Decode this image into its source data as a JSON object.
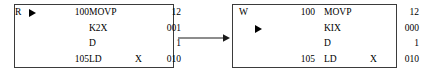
{
  "diagram": {
    "connector": {
      "icon": "right-arrow-icon",
      "direction": "right"
    },
    "panels": [
      {
        "id": "before",
        "position": "left",
        "flag": "R",
        "flag_marker": "right-triangle-marker",
        "flag_marker_row": 0,
        "rows": [
          {
            "step": "100",
            "operand": "MOVP",
            "sub": "",
            "value": "12"
          },
          {
            "step": "",
            "operand": "K2X",
            "sub": "",
            "value": "001"
          },
          {
            "step": "",
            "operand": "D",
            "sub": "",
            "value": "1"
          },
          {
            "step": "105",
            "operand": "LD",
            "sub": "X",
            "value": "010"
          }
        ]
      },
      {
        "id": "after",
        "position": "right",
        "flag": "W",
        "flag_marker": "right-triangle-marker",
        "flag_marker_row": 1,
        "rows": [
          {
            "step": "100",
            "operand": "MOVP",
            "sub": "",
            "value": "12"
          },
          {
            "step": "",
            "operand": "KIX",
            "sub": "",
            "value": "000"
          },
          {
            "step": "",
            "operand": "D",
            "sub": "",
            "value": "1"
          },
          {
            "step": "105",
            "operand": "LD",
            "sub": "X",
            "value": "010"
          }
        ]
      }
    ]
  },
  "colors": {
    "border": "#3b3b3b",
    "text": "#000000",
    "background": "#ffffff"
  }
}
